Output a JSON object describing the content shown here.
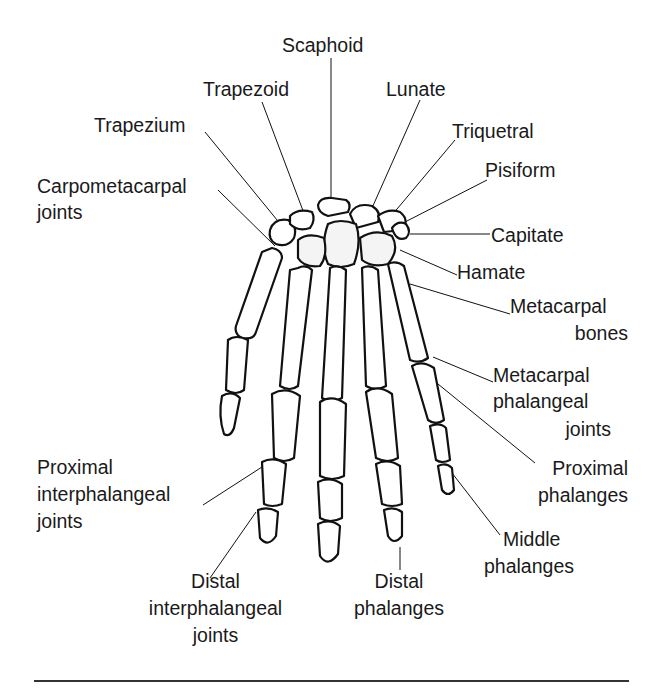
{
  "figure": {
    "labels": {
      "scaphoid": "Scaphoid",
      "trapezoid": "Trapezoid",
      "lunate": "Lunate",
      "trapezium": "Trapezium",
      "triquetral": "Triquetral",
      "pisiform": "Pisiform",
      "carpometacarpal_1": "Carpometacarpal",
      "carpometacarpal_2": "joints",
      "capitate": "Capitate",
      "hamate": "Hamate",
      "metacarpal_bones_1": "Metacarpal",
      "metacarpal_bones_2": "bones",
      "mcp_1": "Metacarpal",
      "mcp_2": "phalangeal",
      "mcp_3": "joints",
      "proximal_phalanges_1": "Proximal",
      "proximal_phalanges_2": "phalanges",
      "pip_1": "Proximal",
      "pip_2": "interphalangeal",
      "pip_3": "joints",
      "middle_phalanges_1": "Middle",
      "middle_phalanges_2": "phalanges",
      "dip_1": "Distal",
      "dip_2": "interphalangeal",
      "dip_3": "joints",
      "distal_phalanges_1": "Distal",
      "distal_phalanges_2": "phalanges"
    }
  }
}
